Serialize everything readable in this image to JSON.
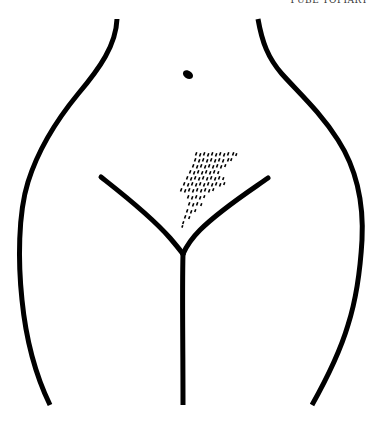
{
  "page": {
    "header": "PUBE TOPIARY",
    "ink_color": "#000000",
    "background_color": "#ffffff"
  },
  "illustration": {
    "subject": "lower-torso-outline",
    "elements": [
      "left-hip-contour",
      "right-hip-contour",
      "navel",
      "groin-v-lines",
      "center-line",
      "lightning-bolt-hair-pattern"
    ],
    "hair_style": "lightning-bolt"
  }
}
